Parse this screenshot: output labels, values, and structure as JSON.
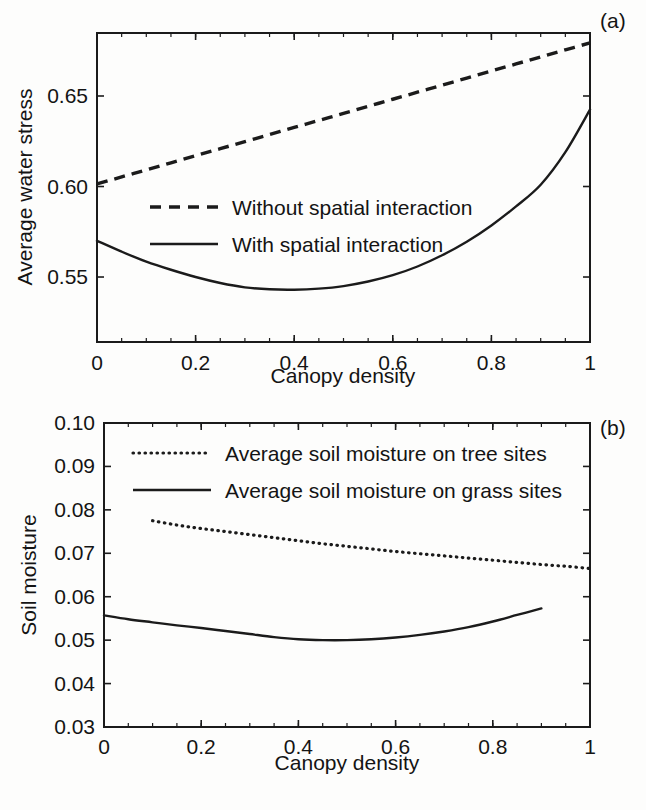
{
  "figure": {
    "background": "#fdfdfc",
    "ink_color": "#1b1b1b"
  },
  "panel_a": {
    "tag": "(a)",
    "xlabel": "Canopy density",
    "ylabel": "Average water stress",
    "xticklabels": [
      "0",
      "0.2",
      "0.4",
      "0.6",
      "0.8",
      "1"
    ],
    "yticklabels": [
      "0.65",
      "0.60",
      "0.55"
    ],
    "legend": [
      {
        "label": "Without spatial interaction",
        "style": "dashed"
      },
      {
        "label": "With spatial interaction",
        "style": "solid"
      }
    ]
  },
  "panel_b": {
    "tag": "(b)",
    "xlabel": "Canopy density",
    "ylabel": "Soil moisture",
    "xticklabels": [
      "0",
      "0.2",
      "0.4",
      "0.6",
      "0.8",
      "1"
    ],
    "yticklabels": [
      "0.10",
      "0.09",
      "0.08",
      "0.07",
      "0.06",
      "0.05",
      "0.04",
      "0.03"
    ],
    "legend": [
      {
        "label": "Average soil moisture on tree sites",
        "style": "dotted"
      },
      {
        "label": "Average soil moisture on grass sites",
        "style": "solid"
      }
    ]
  },
  "chart_data": [
    {
      "type": "line",
      "id": "panel-a",
      "title": "",
      "panel_label": "(a)",
      "xlabel": "Canopy density",
      "ylabel": "Average water stress",
      "xlim": [
        0,
        1
      ],
      "ylim": [
        0.5141,
        0.6848
      ],
      "xticks": [
        0,
        0.2,
        0.4,
        0.6,
        0.8,
        1
      ],
      "xticklabels": [
        "0",
        "0.2",
        "0.4",
        "0.6",
        "0.8",
        "1"
      ],
      "yticks": [
        0.55,
        0.6,
        0.65
      ],
      "yticklabels": [
        "0.55",
        "0.60",
        "0.65"
      ],
      "grid": false,
      "legend_position": "center-left",
      "x": [
        0,
        0.05,
        0.1,
        0.15,
        0.2,
        0.25,
        0.3,
        0.35,
        0.4,
        0.45,
        0.5,
        0.55,
        0.6,
        0.65,
        0.7,
        0.75,
        0.8,
        0.85,
        0.9,
        0.95,
        1
      ],
      "series": [
        {
          "name": "Without spatial interaction",
          "style": "dashed",
          "values": [
            0.6014,
            0.6053,
            0.6092,
            0.6131,
            0.617,
            0.6209,
            0.6248,
            0.6287,
            0.6326,
            0.6365,
            0.6404,
            0.6443,
            0.6482,
            0.6521,
            0.656,
            0.6599,
            0.6638,
            0.6677,
            0.6716,
            0.6755,
            0.6793
          ]
        },
        {
          "name": "With spatial interaction",
          "style": "solid",
          "values": [
            0.57,
            0.564,
            0.5585,
            0.554,
            0.55,
            0.5467,
            0.5443,
            0.5432,
            0.543,
            0.5436,
            0.545,
            0.5475,
            0.551,
            0.5558,
            0.562,
            0.5695,
            0.5785,
            0.589,
            0.601,
            0.619,
            0.6425
          ]
        }
      ]
    },
    {
      "type": "line",
      "id": "panel-b",
      "title": "",
      "panel_label": "(b)",
      "xlabel": "Canopy density",
      "ylabel": "Soil moisture",
      "xlim": [
        0,
        1
      ],
      "ylim": [
        0.03,
        0.1
      ],
      "xticks": [
        0,
        0.2,
        0.4,
        0.6,
        0.8,
        1
      ],
      "xticklabels": [
        "0",
        "0.2",
        "0.4",
        "0.6",
        "0.8",
        "1"
      ],
      "yticks": [
        0.03,
        0.04,
        0.05,
        0.06,
        0.07,
        0.08,
        0.09,
        0.1
      ],
      "yticklabels": [
        "0.03",
        "0.04",
        "0.05",
        "0.06",
        "0.07",
        "0.08",
        "0.09",
        "0.10"
      ],
      "grid": false,
      "legend_position": "top-left",
      "series": [
        {
          "name": "Average soil moisture on tree sites",
          "style": "dotted",
          "x": [
            0.1,
            0.15,
            0.2,
            0.25,
            0.3,
            0.35,
            0.4,
            0.45,
            0.5,
            0.55,
            0.6,
            0.65,
            0.7,
            0.75,
            0.8,
            0.85,
            0.9,
            0.95,
            1
          ],
          "values": [
            0.0775,
            0.0765,
            0.0757,
            0.075,
            0.0743,
            0.0736,
            0.0729,
            0.0722,
            0.0716,
            0.071,
            0.0704,
            0.0699,
            0.0694,
            0.0689,
            0.0684,
            0.0679,
            0.0674,
            0.067,
            0.0665
          ]
        },
        {
          "name": "Average soil moisture on grass sites",
          "style": "solid",
          "x": [
            0,
            0.05,
            0.1,
            0.15,
            0.2,
            0.25,
            0.3,
            0.35,
            0.4,
            0.45,
            0.5,
            0.55,
            0.6,
            0.65,
            0.7,
            0.75,
            0.8,
            0.85,
            0.9
          ],
          "values": [
            0.0557,
            0.0548,
            0.0541,
            0.0534,
            0.0528,
            0.0521,
            0.0514,
            0.0507,
            0.0502,
            0.05,
            0.05,
            0.0502,
            0.0506,
            0.0512,
            0.052,
            0.053,
            0.0543,
            0.0558,
            0.0573
          ]
        }
      ]
    }
  ]
}
